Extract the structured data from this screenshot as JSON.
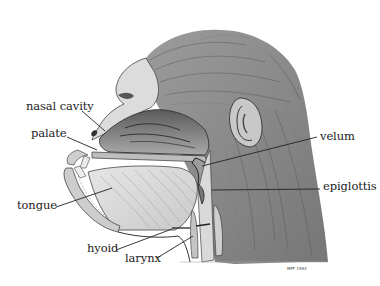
{
  "figure": {
    "signature": "MPF 1993",
    "colors": {
      "background": "#ffffff",
      "ink": "#222222",
      "hair": "#6a6a6a",
      "tissue": "#d8d8d8",
      "cavity": "#8c8c8c"
    }
  },
  "labels": [
    {
      "id": "nasal-cavity",
      "text": "nasal cavity",
      "x": 26,
      "y": 101,
      "target": [
        105,
        131
      ]
    },
    {
      "id": "palate",
      "text": "palate",
      "x": 31,
      "y": 128,
      "target": [
        97,
        150
      ]
    },
    {
      "id": "velum",
      "text": "velum",
      "x": 320,
      "y": 131,
      "target": [
        202,
        166
      ]
    },
    {
      "id": "epiglottis",
      "text": "epiglottis",
      "x": 323,
      "y": 181,
      "target": [
        212,
        190
      ]
    },
    {
      "id": "tongue",
      "text": "tongue",
      "x": 17,
      "y": 200,
      "target": [
        112,
        188
      ]
    },
    {
      "id": "hyoid",
      "text": "hyoid",
      "x": 87,
      "y": 243,
      "target": [
        172,
        229
      ]
    },
    {
      "id": "larynx",
      "text": "larynx",
      "x": 125,
      "y": 253,
      "target": [
        193,
        236
      ]
    }
  ]
}
